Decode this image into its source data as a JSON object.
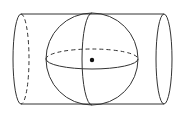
{
  "diagram": {
    "title": "",
    "colors": {
      "stroke": "#333333",
      "background": "#ffffff"
    },
    "cylinder": {
      "top_y": 14,
      "bottom_y": 104,
      "left_cx": 21,
      "right_cx": 164,
      "end_rx": 8
    },
    "sphere": {
      "cx": 92,
      "cy": 59,
      "r": 46,
      "equator_ry": 10
    },
    "center_point": {
      "cx": 92,
      "cy": 60
    }
  }
}
